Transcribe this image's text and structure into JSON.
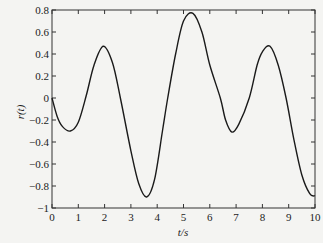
{
  "chart_data": {
    "type": "line",
    "title": "",
    "xlabel": "t/s",
    "ylabel": "r(t)",
    "xlim": [
      0,
      10
    ],
    "ylim": [
      -1,
      0.8
    ],
    "grid": false,
    "legend": null,
    "xticks": [
      0,
      1,
      2,
      3,
      4,
      5,
      6,
      7,
      8,
      9,
      10
    ],
    "xtick_labels": [
      "0",
      "1",
      "2",
      "3",
      "4",
      "5",
      "6",
      "7",
      "8",
      "9",
      "10"
    ],
    "yticks": [
      0.8,
      0.6,
      0.4,
      0.2,
      0,
      -0.2,
      -0.4,
      -0.6,
      -0.8,
      -1
    ],
    "ytick_labels": [
      "0.8",
      "0.6",
      "0.4",
      "0.2",
      "0",
      "−0.2",
      "−0.4",
      "−0.6",
      "−0.8",
      "−1"
    ],
    "series": [
      {
        "name": "r(t)",
        "color": "#1a1a1a",
        "x": [
          0,
          0.2,
          0.4,
          0.7,
          1.0,
          1.3,
          1.6,
          1.95,
          2.3,
          2.6,
          3.0,
          3.3,
          3.6,
          3.9,
          4.2,
          4.4,
          4.7,
          5.0,
          5.36,
          5.7,
          6.0,
          6.4,
          6.6,
          6.84,
          7.1,
          7.5,
          7.8,
          8.0,
          8.29,
          8.6,
          8.9,
          9.2,
          9.5,
          9.8,
          10.0
        ],
        "y": [
          0,
          -0.17,
          -0.26,
          -0.3,
          -0.22,
          0.02,
          0.3,
          0.47,
          0.32,
          0.0,
          -0.48,
          -0.78,
          -0.9,
          -0.74,
          -0.3,
          0.0,
          0.4,
          0.7,
          0.77,
          0.6,
          0.3,
          0.0,
          -0.2,
          -0.31,
          -0.24,
          0.0,
          0.3,
          0.42,
          0.47,
          0.3,
          0.0,
          -0.38,
          -0.7,
          -0.87,
          -0.89
        ]
      }
    ]
  }
}
